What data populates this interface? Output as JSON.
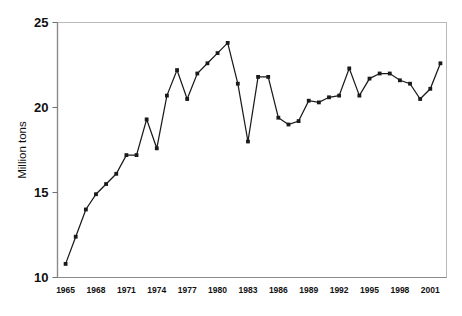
{
  "chart_data": {
    "type": "line",
    "title": "",
    "subtitle": "",
    "xlabel": "",
    "ylabel": "Million tons",
    "xlim": [
      1964.2,
      2002.6
    ],
    "ylim": [
      10,
      25
    ],
    "yticks": [
      10,
      15,
      20,
      25
    ],
    "xticks": [
      1965,
      1968,
      1971,
      1974,
      1977,
      1980,
      1983,
      1986,
      1989,
      1992,
      1995,
      1998,
      2001
    ],
    "ytick_labels": [
      "10",
      "15",
      "20",
      "25"
    ],
    "xtick_labels": [
      "1965",
      "1968",
      "1971",
      "1974",
      "1977",
      "1980",
      "1983",
      "1986",
      "1989",
      "1992",
      "1995",
      "1998",
      "2001"
    ],
    "grid": false,
    "legend": false,
    "legend_position": "none",
    "marker": "square",
    "line_color": "#1a1a1a",
    "marker_color": "#1a1a1a",
    "frame_color": "#b9b9b9",
    "x": [
      1965,
      1966,
      1967,
      1968,
      1969,
      1970,
      1971,
      1972,
      1973,
      1974,
      1975,
      1976,
      1977,
      1978,
      1979,
      1980,
      1981,
      1982,
      1983,
      1984,
      1985,
      1986,
      1987,
      1988,
      1989,
      1990,
      1991,
      1992,
      1993,
      1994,
      1995,
      1996,
      1997,
      1998,
      1999,
      2000,
      2001,
      2002
    ],
    "series": [
      {
        "name": "Million tons",
        "values": [
          10.8,
          12.4,
          14.0,
          14.9,
          15.5,
          16.1,
          17.2,
          17.2,
          19.3,
          17.6,
          20.7,
          22.2,
          20.5,
          22.0,
          22.6,
          23.2,
          23.8,
          21.4,
          18.0,
          21.8,
          21.8,
          19.4,
          19.0,
          19.2,
          20.4,
          20.3,
          20.6,
          20.7,
          22.3,
          20.7,
          21.7,
          22.0,
          22.0,
          21.6,
          21.4,
          20.5,
          21.1,
          22.6
        ]
      }
    ]
  },
  "axes": {
    "ylabel_text": "Million tons"
  }
}
